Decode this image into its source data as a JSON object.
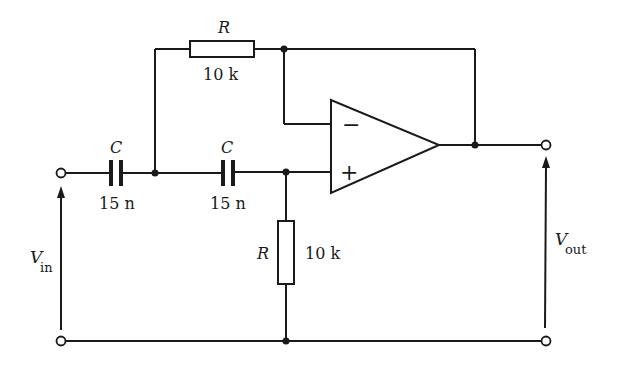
{
  "diagram": {
    "type": "circuit-schematic",
    "colors": {
      "stroke": "#1a1a1a",
      "background": "#ffffff"
    },
    "components": {
      "r_feedback": {
        "symbol": "R",
        "value": "10 k"
      },
      "r_ground": {
        "symbol": "R",
        "value": "10 k"
      },
      "c1": {
        "symbol": "C",
        "value": "15 n"
      },
      "c2": {
        "symbol": "C",
        "value": "15 n"
      },
      "opamp": {
        "inverting": "−",
        "non_inverting": "+"
      }
    },
    "terminals": {
      "input": {
        "symbol": "V",
        "subscript": "in"
      },
      "output": {
        "symbol": "V",
        "subscript": "out"
      }
    }
  }
}
